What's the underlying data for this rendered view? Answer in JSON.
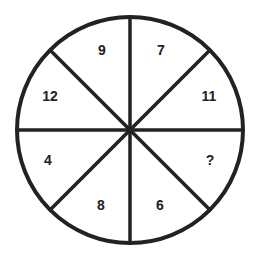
{
  "diagram": {
    "type": "number-wheel-puzzle",
    "center": [
      130,
      130
    ],
    "radius": 113,
    "stroke_color": "#222222",
    "background_color": "#ffffff",
    "segments": [
      {
        "position": "top-left",
        "value": "9",
        "label_xy": [
          102,
          50
        ]
      },
      {
        "position": "top-right",
        "value": "7",
        "label_xy": [
          161,
          50
        ]
      },
      {
        "position": "right-upper",
        "value": "11",
        "label_xy": [
          209,
          96
        ]
      },
      {
        "position": "right-lower",
        "value": "?",
        "label_xy": [
          210,
          160
        ]
      },
      {
        "position": "bottom-right",
        "value": "6",
        "label_xy": [
          160,
          205
        ]
      },
      {
        "position": "bottom-left",
        "value": "8",
        "label_xy": [
          101,
          205
        ]
      },
      {
        "position": "left-lower",
        "value": "4",
        "label_xy": [
          48,
          160
        ]
      },
      {
        "position": "left-upper",
        "value": "12",
        "label_xy": [
          50,
          96
        ]
      }
    ],
    "unknown_marker": "?"
  }
}
